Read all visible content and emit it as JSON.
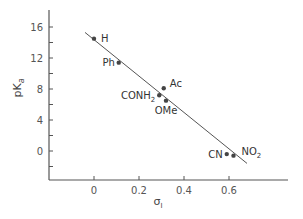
{
  "chart_data": {
    "type": "scatter",
    "title": "",
    "xlabel": "σI",
    "xlabel_main": "σ",
    "xlabel_sub": "I",
    "ylabel": "pKa",
    "ylabel_main": "pK",
    "ylabel_sub": "a",
    "xlim": [
      -0.24,
      0.86
    ],
    "ylim": [
      -3.7,
      18
    ],
    "x_ticks": [
      0,
      0.2,
      0.4,
      0.6
    ],
    "x_tick_labels": [
      "0",
      "0.2",
      "0.4",
      "0.6"
    ],
    "y_ticks": [
      -2,
      0,
      2,
      4,
      6,
      8,
      10,
      12,
      14,
      16
    ],
    "y_tick_labels": [
      "0",
      "4",
      "8",
      "12",
      "16"
    ],
    "y_labeled_ticks": [
      0,
      4,
      8,
      12,
      16
    ],
    "grid": false,
    "legend": null,
    "points": [
      {
        "label": "H",
        "x": 0.0,
        "y": 14.5
      },
      {
        "label": "Ph",
        "x": 0.11,
        "y": 11.4
      },
      {
        "label": "Ac",
        "x": 0.31,
        "y": 8.1
      },
      {
        "label": "CONH2",
        "x": 0.29,
        "y": 7.2
      },
      {
        "label": "OMe",
        "x": 0.32,
        "y": 6.5
      },
      {
        "label": "CN",
        "x": 0.59,
        "y": -0.4
      },
      {
        "label": "NO2",
        "x": 0.62,
        "y": -0.6
      }
    ],
    "fit_line": {
      "x_start": -0.04,
      "y_start": 15.3,
      "x_end": 0.68,
      "y_end": -1.6
    },
    "colors": {
      "axis": "#555555",
      "point": "#444444",
      "line": "#555555"
    }
  }
}
